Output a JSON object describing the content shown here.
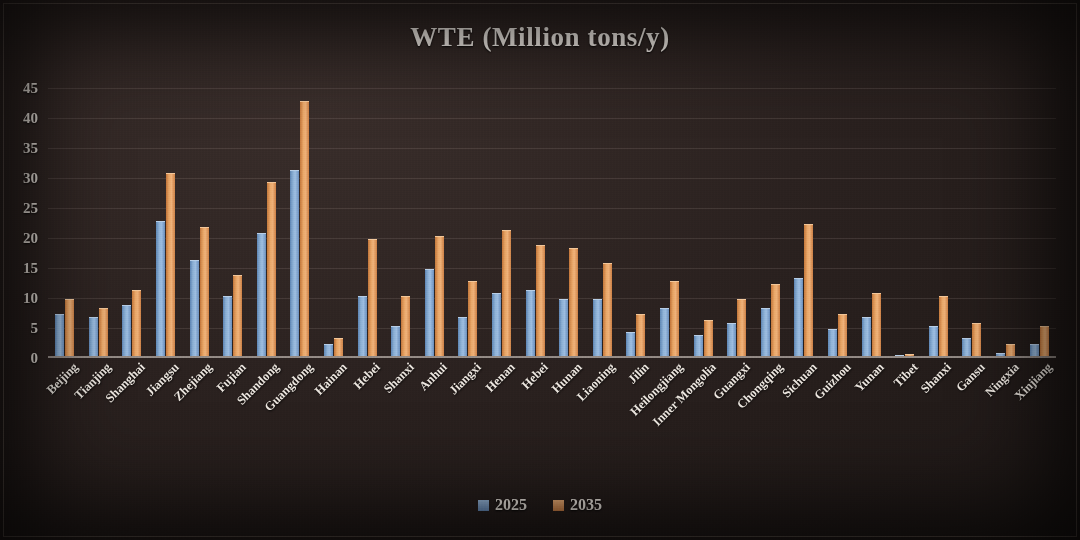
{
  "chart_data": {
    "type": "bar",
    "title": "WTE (Million tons/y)",
    "xlabel": "",
    "ylabel": "",
    "ylim": [
      0,
      45
    ],
    "ytick_step": 5,
    "yticks": [
      "45",
      "40",
      "35",
      "30",
      "25",
      "20",
      "15",
      "10",
      "5",
      "0"
    ],
    "grid": true,
    "legend_position": "bottom",
    "colors": {
      "series_2025": "#8fb2d6",
      "series_2035": "#e8a667",
      "background": "#2b2220",
      "text": "#ece6df",
      "gridline": "#bfaf a5"
    },
    "categories": [
      "Beijing",
      "Tianjing",
      "Shanghai",
      "Jiangsu",
      "Zhejiang",
      "Fujian",
      "Shandong",
      "Guangdong",
      "Hainan",
      "Hebei",
      "Shanxi",
      "Anhui",
      "Jiangxi",
      "Henan",
      "Hebei",
      "Hunan",
      "Liaoning",
      "Jilin",
      "Heilongjiang",
      "Inner Mongolia",
      "Guangxi",
      "Chongqing",
      "Sichuan",
      "Guizhou",
      "Yunan",
      "Tibet",
      "Shanxi",
      "Gansu",
      "Ningxia",
      "Xinjiang"
    ],
    "series": [
      {
        "name": "2025",
        "color": "#8fb2d6",
        "values": [
          7,
          6.5,
          8.5,
          22.5,
          16,
          10,
          20.5,
          31,
          2,
          10,
          5,
          14.5,
          6.5,
          10.5,
          11,
          9.5,
          9.5,
          4,
          8,
          3.5,
          5.5,
          8,
          13,
          4.5,
          6.5,
          0.2,
          5,
          3,
          0.5,
          2
        ]
      },
      {
        "name": "2035",
        "color": "#e8a667",
        "values": [
          9.5,
          8,
          11,
          30.5,
          21.5,
          13.5,
          29,
          42.5,
          3,
          19.5,
          10,
          20,
          12.5,
          21,
          18.5,
          18,
          15.5,
          7,
          12.5,
          6,
          9.5,
          12,
          22,
          7,
          10.5,
          0.3,
          10,
          5.5,
          2,
          5
        ]
      }
    ]
  },
  "legend": {
    "items": [
      {
        "label": "2025"
      },
      {
        "label": "2035"
      }
    ]
  }
}
